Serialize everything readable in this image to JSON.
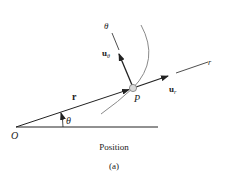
{
  "figure": {
    "caption": "Position",
    "sublabel": "(a)"
  },
  "labels": {
    "origin": "O",
    "point": "P",
    "position_vector": "r",
    "angle": "θ",
    "radial_axis": "r",
    "transverse_axis": "θ",
    "unit_radial": "u",
    "unit_radial_sub": "r",
    "unit_transverse": "u",
    "unit_transverse_sub": "θ"
  },
  "colors": {
    "line": "#222222",
    "curve": "#888888",
    "particle_fill": "#d8d8d8"
  }
}
